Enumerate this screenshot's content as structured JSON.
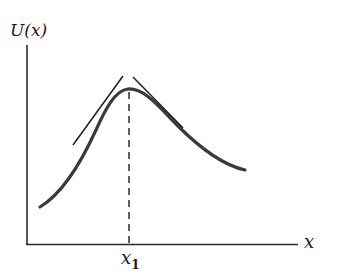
{
  "diagram": {
    "y_axis_label": "U(x)",
    "x_axis_label": "x",
    "marker_label": "x",
    "marker_subscript": "1",
    "colors": {
      "axis": "#2a2a2a",
      "curve": "#3a3a3a",
      "tangent": "#1e1e1e",
      "dashed": "#2a2a2a",
      "background": "#ffffff"
    },
    "elements": [
      {
        "type": "axis",
        "name": "y-axis"
      },
      {
        "type": "axis",
        "name": "x-axis"
      },
      {
        "type": "curve",
        "name": "potential-curve",
        "description": "single-peaked curve with maximum at x1"
      },
      {
        "type": "line",
        "name": "tangent-left",
        "description": "tangent line on rising side near peak"
      },
      {
        "type": "line",
        "name": "tangent-right",
        "description": "tangent line on falling side near peak"
      },
      {
        "type": "dashed-line",
        "name": "x1-marker",
        "description": "vertical dashed line from peak down to x-axis at x1"
      }
    ]
  }
}
